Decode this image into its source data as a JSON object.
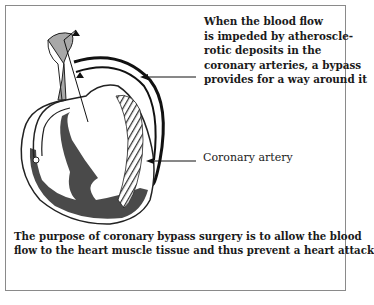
{
  "figure": {
    "labels": {
      "bypass": {
        "lines": [
          "When the blood flow",
          "is impeded by atheroscle-",
          "rotic deposits in the",
          "coronary arteries, a bypass",
          "provides for a way around it"
        ]
      },
      "coronary_artery": "Coronary artery"
    },
    "caption": {
      "lines": [
        "The purpose of coronary bypass surgery is to allow the blood",
        "flow to the heart muscle tissue and thus prevent a heart attack"
      ]
    },
    "colors": {
      "border": "#8a8a8a",
      "ink": "#1a1a1a",
      "muscle": "#4a4a4a",
      "aorta_fill": "#a8a8a8",
      "background": "#ffffff"
    }
  }
}
